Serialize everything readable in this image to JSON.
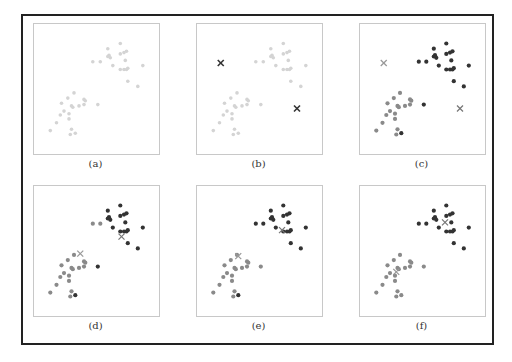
{
  "figure": {
    "colors": {
      "unassigned": "#d4d4d4",
      "cluster_1": "#8a8a8a",
      "cluster_2": "#333333",
      "centroid_initial": "#333333",
      "centroid_1": "#999999",
      "centroid_2": "#777777"
    },
    "points": [
      [
        0.59,
        0.19
      ],
      [
        0.69,
        0.15
      ],
      [
        0.69,
        0.23
      ],
      [
        0.72,
        0.22
      ],
      [
        0.74,
        0.21
      ],
      [
        0.6,
        0.24
      ],
      [
        0.61,
        0.26
      ],
      [
        0.59,
        0.25
      ],
      [
        0.73,
        0.28
      ],
      [
        0.63,
        0.32
      ],
      [
        0.69,
        0.35
      ],
      [
        0.72,
        0.35
      ],
      [
        0.74,
        0.35
      ],
      [
        0.75,
        0.34
      ],
      [
        0.87,
        0.32
      ],
      [
        0.75,
        0.44
      ],
      [
        0.83,
        0.48
      ],
      [
        0.47,
        0.29
      ],
      [
        0.53,
        0.29
      ],
      [
        0.51,
        0.62
      ],
      [
        0.32,
        0.53
      ],
      [
        0.27,
        0.57
      ],
      [
        0.22,
        0.61
      ],
      [
        0.3,
        0.63
      ],
      [
        0.31,
        0.64
      ],
      [
        0.36,
        0.63
      ],
      [
        0.4,
        0.58
      ],
      [
        0.41,
        0.59
      ],
      [
        0.4,
        0.62
      ],
      [
        0.24,
        0.67
      ],
      [
        0.28,
        0.69
      ],
      [
        0.21,
        0.7
      ],
      [
        0.28,
        0.73
      ],
      [
        0.18,
        0.76
      ],
      [
        0.13,
        0.82
      ],
      [
        0.3,
        0.81
      ],
      [
        0.29,
        0.85
      ],
      [
        0.33,
        0.84
      ]
    ],
    "panels": [
      {
        "label": "(a)",
        "assignments": "none",
        "centroids": []
      },
      {
        "label": "(b)",
        "assignments": "none",
        "centroids": [
          [
            0.19,
            0.3
          ],
          [
            0.8,
            0.65
          ]
        ]
      },
      {
        "label": "(c)",
        "assignments": [
          2,
          2,
          2,
          2,
          2,
          2,
          2,
          2,
          2,
          2,
          2,
          2,
          2,
          2,
          2,
          2,
          2,
          2,
          2,
          2,
          1,
          1,
          1,
          1,
          1,
          1,
          1,
          1,
          1,
          1,
          1,
          1,
          1,
          1,
          1,
          1,
          1,
          2
        ],
        "centroids": [
          [
            0.19,
            0.3
          ],
          [
            0.8,
            0.65
          ]
        ]
      },
      {
        "label": "(d)",
        "assignments": [
          2,
          2,
          2,
          2,
          2,
          2,
          2,
          2,
          2,
          2,
          2,
          2,
          2,
          2,
          2,
          2,
          2,
          1,
          1,
          2,
          1,
          1,
          1,
          1,
          1,
          1,
          1,
          1,
          1,
          1,
          1,
          1,
          1,
          1,
          1,
          1,
          1,
          2
        ],
        "centroids": [
          [
            0.37,
            0.52
          ],
          [
            0.7,
            0.39
          ]
        ]
      },
      {
        "label": "(e)",
        "assignments": [
          2,
          2,
          2,
          2,
          2,
          2,
          2,
          2,
          2,
          2,
          2,
          2,
          2,
          2,
          2,
          2,
          2,
          2,
          2,
          1,
          1,
          1,
          1,
          1,
          1,
          1,
          1,
          1,
          1,
          1,
          1,
          1,
          1,
          1,
          1,
          1,
          1,
          2
        ],
        "centroids": [
          [
            0.33,
            0.54
          ],
          [
            0.68,
            0.34
          ]
        ]
      },
      {
        "label": "(f)",
        "assignments": [
          2,
          2,
          2,
          2,
          2,
          2,
          2,
          2,
          2,
          2,
          2,
          2,
          2,
          2,
          2,
          2,
          2,
          2,
          2,
          1,
          1,
          1,
          1,
          1,
          1,
          1,
          1,
          1,
          1,
          1,
          1,
          1,
          1,
          1,
          1,
          1,
          1,
          1
        ],
        "centroids": [
          [
            0.29,
            0.66
          ],
          [
            0.68,
            0.28
          ]
        ]
      }
    ]
  }
}
